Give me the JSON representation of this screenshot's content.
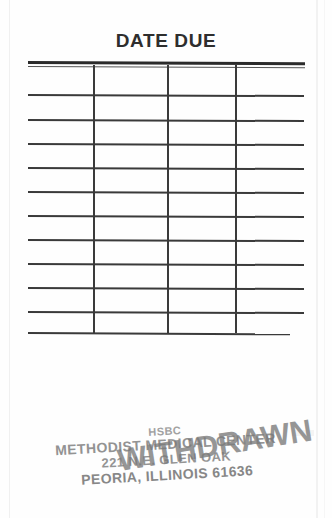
{
  "document": {
    "type": "library-date-due-slip",
    "title": "DATE DUE"
  },
  "table": {
    "columns": 4,
    "rows": 11,
    "header_rule": "double",
    "cells": [
      [
        "",
        "",
        "",
        ""
      ],
      [
        "",
        "",
        "",
        ""
      ],
      [
        "",
        "",
        "",
        ""
      ],
      [
        "",
        "",
        "",
        ""
      ],
      [
        "",
        "",
        "",
        ""
      ],
      [
        "",
        "",
        "",
        ""
      ],
      [
        "",
        "",
        "",
        ""
      ],
      [
        "",
        "",
        "",
        ""
      ],
      [
        "",
        "",
        "",
        ""
      ],
      [
        "",
        "",
        "",
        ""
      ],
      [
        "",
        "",
        "",
        ""
      ]
    ]
  },
  "stamp": {
    "organization_abbrev": "HSBC",
    "organization": "METHODIST MEDICAL CENTER",
    "address": "221 N.E. GLEN OAK",
    "city_state_zip": "PEORIA, ILLINOIS 61636",
    "overlay": "WITHDRAWN",
    "ink_color": "#8a8a8a"
  },
  "colors": {
    "paper": "#fefefe",
    "rule": "#3a3a3a",
    "title": "#2e2e2e",
    "stamp_ink": "#8a8a8a"
  }
}
